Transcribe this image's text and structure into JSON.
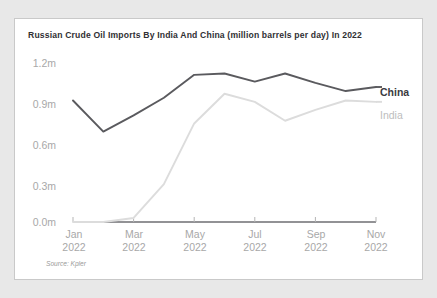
{
  "chart_data": {
    "type": "line",
    "title": "Russian Crude Oil Imports By India And China (million barrels per day) In 2022",
    "xlabel": "",
    "ylabel": "",
    "source": "Source: Kpler",
    "grid": false,
    "legend_position": "right-inline",
    "ylim": [
      0.0,
      1.2
    ],
    "yticks": [
      "0.0m",
      "0.3m",
      "0.6m",
      "0.9m",
      "1.2m"
    ],
    "ytick_values": [
      0.0,
      0.3,
      0.6,
      0.9,
      1.2
    ],
    "categories": [
      "Jan 2022",
      "Feb 2022",
      "Mar 2022",
      "Apr 2022",
      "May 2022",
      "Jun 2022",
      "Jul 2022",
      "Aug 2022",
      "Sep 2022",
      "Oct 2022",
      "Nov 2022"
    ],
    "xticks": [
      {
        "line1": "Jan",
        "line2": "2022"
      },
      {
        "line1": "Mar",
        "line2": "2022"
      },
      {
        "line1": "May",
        "line2": "2022"
      },
      {
        "line1": "Jul",
        "line2": "2022"
      },
      {
        "line1": "Sep",
        "line2": "2022"
      },
      {
        "line1": "Nov",
        "line2": "2022"
      }
    ],
    "series": [
      {
        "name": "China",
        "color": "#5a5a5e",
        "values": [
          0.9,
          0.67,
          0.79,
          0.92,
          1.09,
          1.1,
          1.04,
          1.1,
          1.03,
          0.97,
          1.0
        ]
      },
      {
        "name": "India",
        "color": "#dcdcdc",
        "values": [
          0.0,
          0.0,
          0.03,
          0.28,
          0.73,
          0.95,
          0.89,
          0.75,
          0.83,
          0.9,
          0.89
        ]
      }
    ]
  }
}
